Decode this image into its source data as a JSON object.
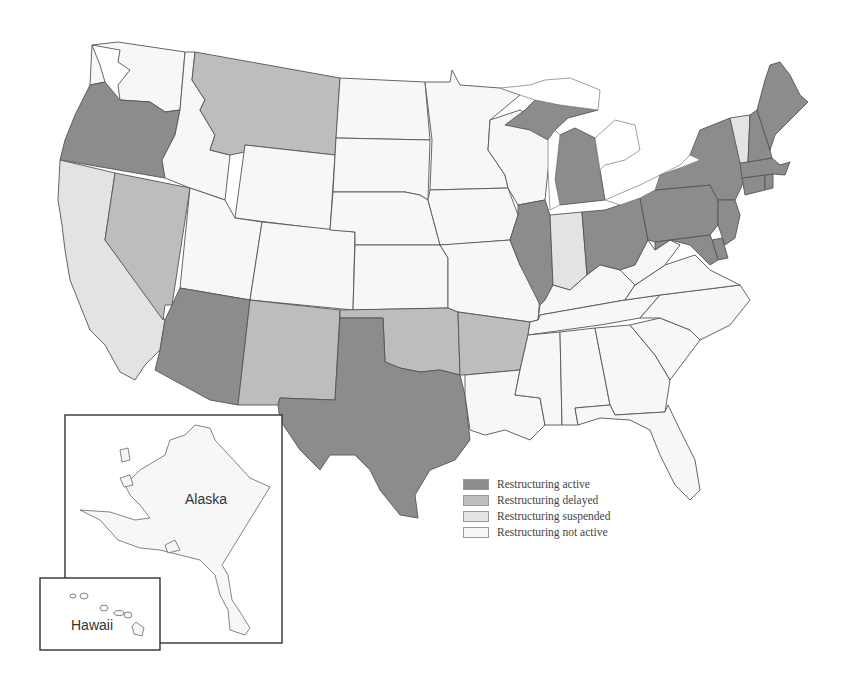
{
  "map": {
    "type": "choropleth",
    "region": "United States",
    "categories": {
      "active": {
        "label": "Restructuring active",
        "color": "#8c8c8c"
      },
      "delayed": {
        "label": "Restructuring delayed",
        "color": "#bdbdbd"
      },
      "suspended": {
        "label": "Restructuring suspended",
        "color": "#e3e3e3"
      },
      "not_active": {
        "label": "Restructuring not active",
        "color": "#f7f7f7"
      }
    },
    "states": {
      "WA": "not_active",
      "OR": "active",
      "CA": "suspended",
      "NV": "delayed",
      "ID": "not_active",
      "MT": "delayed",
      "WY": "not_active",
      "UT": "not_active",
      "CO": "not_active",
      "AZ": "active",
      "NM": "delayed",
      "ND": "not_active",
      "SD": "not_active",
      "NE": "not_active",
      "KS": "not_active",
      "OK": "delayed",
      "TX": "active",
      "MN": "not_active",
      "IA": "not_active",
      "MO": "not_active",
      "AR": "delayed",
      "LA": "not_active",
      "WI": "not_active",
      "IL": "active",
      "MI": "active",
      "IN": "suspended",
      "OH": "active",
      "KY": "not_active",
      "TN": "not_active",
      "MS": "not_active",
      "AL": "not_active",
      "GA": "not_active",
      "FL": "not_active",
      "SC": "not_active",
      "NC": "not_active",
      "VA": "not_active",
      "WV": "not_active",
      "PA": "active",
      "NY": "active",
      "NJ": "active",
      "DE": "active",
      "MD": "active",
      "CT": "active",
      "RI": "active",
      "MA": "active",
      "VT": "suspended",
      "NH": "active",
      "ME": "active",
      "AK": "not_active",
      "HI": "not_active"
    },
    "insets": {
      "alaska_label": "Alaska",
      "hawaii_label": "Hawaii"
    }
  },
  "legend": {
    "items": [
      {
        "label": "Restructuring active",
        "color": "#8c8c8c"
      },
      {
        "label": "Restructuring delayed",
        "color": "#bdbdbd"
      },
      {
        "label": "Restructuring suspended",
        "color": "#e3e3e3"
      },
      {
        "label": "Restructuring not active",
        "color": "#f7f7f7"
      }
    ]
  }
}
